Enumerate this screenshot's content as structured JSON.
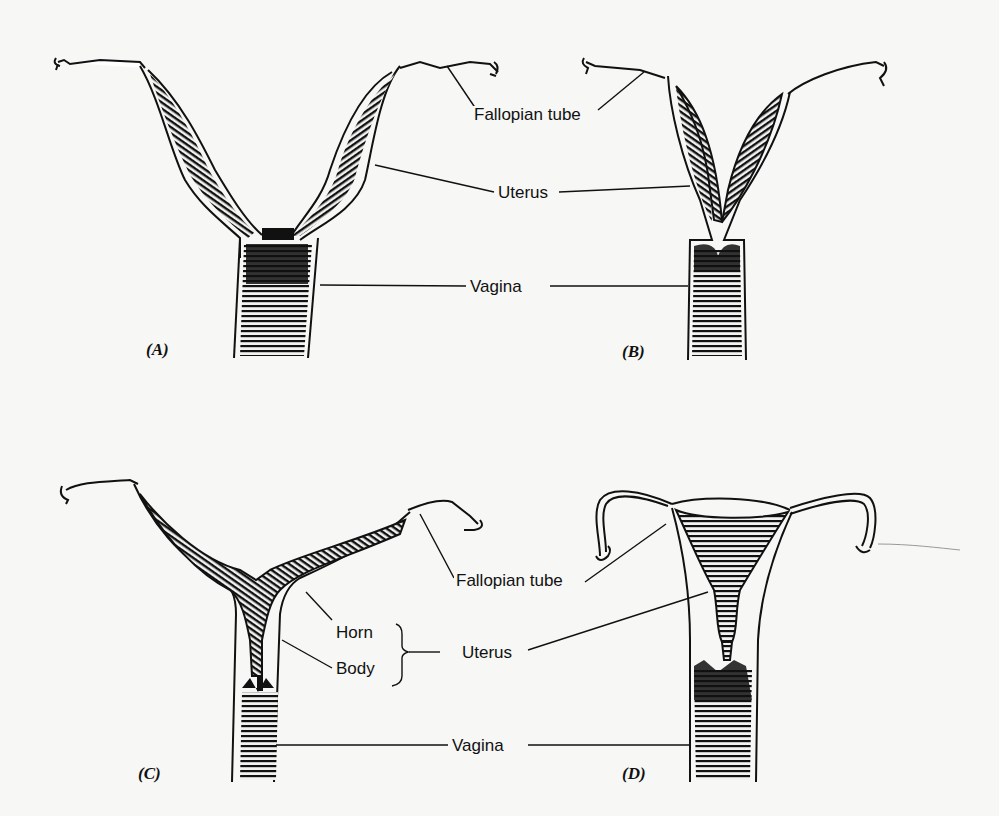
{
  "panels": [
    {
      "id": "A",
      "label": "(A)"
    },
    {
      "id": "B",
      "label": "(B)"
    },
    {
      "id": "C",
      "label": "(C)"
    },
    {
      "id": "D",
      "label": "(D)"
    }
  ],
  "top_labels": {
    "fallopian_tube": "Fallopian tube",
    "uterus": "Uterus",
    "vagina": "Vagina"
  },
  "bottom_labels": {
    "fallopian_tube": "Fallopian tube",
    "horn": "Horn",
    "body": "Body",
    "uterus": "Uterus",
    "vagina": "Vagina"
  },
  "colors": {
    "ink": "#111111",
    "paper": "#f7f7f5"
  }
}
